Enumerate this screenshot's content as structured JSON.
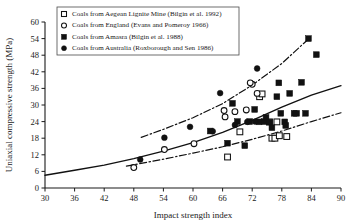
{
  "chart_data": {
    "type": "scatter",
    "title": "",
    "xlabel": "Impact strength index",
    "ylabel": "Uniaxial compressive strength (MPa)",
    "xlim": [
      30,
      90
    ],
    "ylim": [
      0,
      60
    ],
    "xticks": [
      30,
      36,
      42,
      48,
      54,
      60,
      66,
      72,
      78,
      84,
      90
    ],
    "yticks": [
      0,
      6,
      12,
      18,
      24,
      30,
      36,
      42,
      48,
      54,
      60
    ],
    "grid": false,
    "legend_position": "top-left",
    "series": [
      {
        "name": "Coals from Aegean Lignite Mine (Bilgin et al. 1992)",
        "marker": "open-square",
        "points": [
          [
            67.0,
            11.2
          ],
          [
            69.5,
            20.3
          ],
          [
            73.5,
            33.0
          ],
          [
            74.0,
            34.0
          ],
          [
            76.0,
            18.0
          ],
          [
            76.6,
            18.0
          ],
          [
            77.5,
            18.9
          ],
          [
            79.0,
            18.6
          ],
          [
            75.5,
            23.9
          ],
          [
            77.0,
            23.9
          ]
        ]
      },
      {
        "name": "Coals from England (Evans and Pomeroy 1966)",
        "marker": "open-circle",
        "points": [
          [
            48.0,
            7.4
          ],
          [
            54.2,
            13.9
          ],
          [
            60.2,
            16.0
          ],
          [
            66.3,
            28.0
          ],
          [
            66.5,
            25.7
          ],
          [
            68.5,
            27.6
          ],
          [
            70.8,
            28.2
          ],
          [
            73.0,
            34.2
          ],
          [
            72.0,
            37.5
          ],
          [
            71.6,
            38.0
          ]
        ]
      },
      {
        "name": "Coals from Amasra (Bilgin et al. 1988)",
        "marker": "filled-square",
        "points": [
          [
            67.0,
            16.2
          ],
          [
            68.0,
            30.6
          ],
          [
            69.0,
            24.0
          ],
          [
            70.5,
            15.3
          ],
          [
            71.5,
            24.0
          ],
          [
            72.5,
            28.4
          ],
          [
            73.4,
            23.9
          ],
          [
            74.5,
            24.0
          ],
          [
            74.8,
            25.5
          ],
          [
            75.5,
            23.8
          ],
          [
            76.0,
            21.8
          ],
          [
            77.0,
            33.0
          ],
          [
            77.4,
            38.0
          ],
          [
            77.8,
            27.0
          ],
          [
            78.6,
            23.9
          ],
          [
            78.8,
            22.6
          ],
          [
            79.6,
            34.2
          ],
          [
            80.5,
            27.0
          ],
          [
            81.0,
            27.0
          ],
          [
            82.0,
            38.2
          ],
          [
            82.8,
            27.0
          ],
          [
            83.4,
            54.0
          ],
          [
            85.0,
            48.2
          ],
          [
            63.5,
            20.6
          ]
        ]
      },
      {
        "name": "Coals from Australia (Roxborough and Sen 1986)",
        "marker": "filled-circle",
        "points": [
          [
            49.3,
            10.3
          ],
          [
            54.2,
            18.2
          ],
          [
            59.4,
            22.1
          ],
          [
            64.0,
            20.5
          ],
          [
            65.5,
            34.3
          ],
          [
            71.0,
            23.9
          ],
          [
            72.6,
            24.0
          ],
          [
            73.0,
            43.2
          ],
          [
            68.5,
            22.8
          ]
        ]
      }
    ],
    "fit_curves": [
      {
        "name": "mean-trend",
        "style": "solid",
        "points": [
          [
            30,
            4.6
          ],
          [
            36,
            6.4
          ],
          [
            42,
            8.3
          ],
          [
            48,
            10.6
          ],
          [
            54,
            13.3
          ],
          [
            60,
            16.4
          ],
          [
            66,
            20.1
          ],
          [
            72,
            24.4
          ],
          [
            78,
            29.2
          ],
          [
            84,
            33.6
          ],
          [
            90,
            37.0
          ]
        ]
      },
      {
        "name": "upper-bound",
        "style": "dash-dot",
        "points": [
          [
            49.5,
            18.3
          ],
          [
            54,
            21.2
          ],
          [
            60,
            25.4
          ],
          [
            66,
            30.5
          ],
          [
            72,
            37.2
          ],
          [
            78,
            45.0
          ],
          [
            83.5,
            54.0
          ]
        ]
      },
      {
        "name": "lower-bound",
        "style": "dash-dot",
        "points": [
          [
            46.5,
            7.9
          ],
          [
            54,
            10.4
          ],
          [
            60,
            12.6
          ],
          [
            66,
            14.9
          ],
          [
            72,
            17.6
          ],
          [
            78,
            20.6
          ],
          [
            84,
            24.0
          ],
          [
            90,
            27.2
          ]
        ]
      }
    ]
  },
  "legend": {
    "items": [
      {
        "marker": "open-square",
        "label": "Coals from  Aegean Lignite Mine (Bilgin et al. 1992)"
      },
      {
        "marker": "open-circle",
        "label": "Coals from England (Evans and Pomeroy 1966)"
      },
      {
        "marker": "filled-square",
        "label": "Coals from Amasra (Bilgin et al. 1988)"
      },
      {
        "marker": "filled-circle",
        "label": "Coals from Australia (Roxborough and Sen 1986)"
      }
    ]
  },
  "colors": {
    "ink": "#111111",
    "legend_border": "#4a4a4a",
    "background": "#ffffff"
  }
}
